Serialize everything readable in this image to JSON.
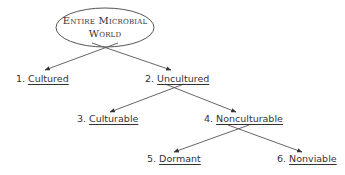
{
  "diagram": {
    "root": {
      "line1": "Entire Microbial",
      "line2": "World"
    },
    "nodes": [
      {
        "number": "1.",
        "label": "Cultured"
      },
      {
        "number": "2.",
        "label": "Uncultured"
      },
      {
        "number": "3.",
        "label": "Culturable"
      },
      {
        "number": "4.",
        "label": "Nonculturable"
      },
      {
        "number": "5.",
        "label": "Dormant"
      },
      {
        "number": "6.",
        "label": "Nonviable"
      }
    ],
    "edges": [
      {
        "from": "root",
        "to": "1"
      },
      {
        "from": "root",
        "to": "2"
      },
      {
        "from": "2",
        "to": "3"
      },
      {
        "from": "2",
        "to": "4"
      },
      {
        "from": "4",
        "to": "5"
      },
      {
        "from": "4",
        "to": "6"
      }
    ],
    "colors": {
      "line": "#555555",
      "text": "#333333",
      "background": "#ffffff"
    }
  }
}
